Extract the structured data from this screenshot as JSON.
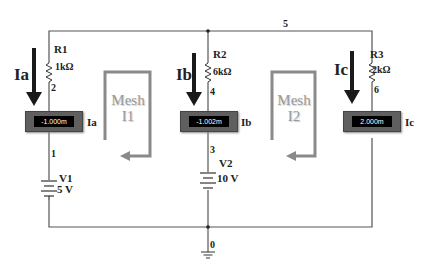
{
  "circuit": {
    "top_node_label": "5",
    "ground_node_label": "0",
    "colors": {
      "wire": "#555555",
      "arrow": "#1a1a1a",
      "mesh_loop": "#8a8a8a",
      "ammeter_body": "#5f5f5f",
      "ammeter_display": "#000000"
    },
    "branches": [
      {
        "current_label": "Ia",
        "resistor": {
          "name": "R1",
          "value": "1kΩ"
        },
        "node_below_resistor": "2",
        "ammeter": {
          "reading": "-1.000m",
          "label": "Ia"
        },
        "node_below_ammeter": "1",
        "source": {
          "name": "V1",
          "value": "5 V"
        }
      },
      {
        "current_label": "Ib",
        "resistor": {
          "name": "R2",
          "value": "6kΩ"
        },
        "node_below_resistor": "4",
        "ammeter": {
          "reading": "-1.002m",
          "label": "Ib"
        },
        "node_below_ammeter": "3",
        "source": {
          "name": "V2",
          "value": "10 V"
        }
      },
      {
        "current_label": "Ic",
        "resistor": {
          "name": "R3",
          "value": "2kΩ"
        },
        "node_below_resistor": "6",
        "ammeter": {
          "reading": "2.000m",
          "label": "Ic"
        }
      }
    ],
    "meshes": [
      {
        "line1": "Mesh",
        "line2": "I1"
      },
      {
        "line1": "Mesh",
        "line2": "I2"
      }
    ]
  }
}
